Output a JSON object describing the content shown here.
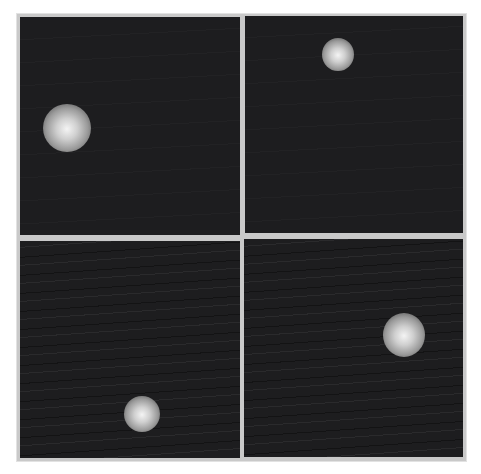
{
  "figure": {
    "layout": "2x2 grid",
    "gutter_color": "#c9c9c9",
    "panel_background": "#1d1d1f",
    "panels": [
      {
        "id": "top-left",
        "blob": {
          "cx": 67,
          "cy": 128,
          "r": 24
        },
        "streaks": false
      },
      {
        "id": "top-right",
        "blob": {
          "cx": 338,
          "cy": 54,
          "r": 16
        },
        "streaks": false
      },
      {
        "id": "bottom-left",
        "blob": {
          "cx": 142,
          "cy": 414,
          "r": 18
        },
        "streaks": true
      },
      {
        "id": "bottom-right",
        "blob": {
          "cx": 404,
          "cy": 335,
          "r": 21
        },
        "streaks": true
      }
    ]
  }
}
